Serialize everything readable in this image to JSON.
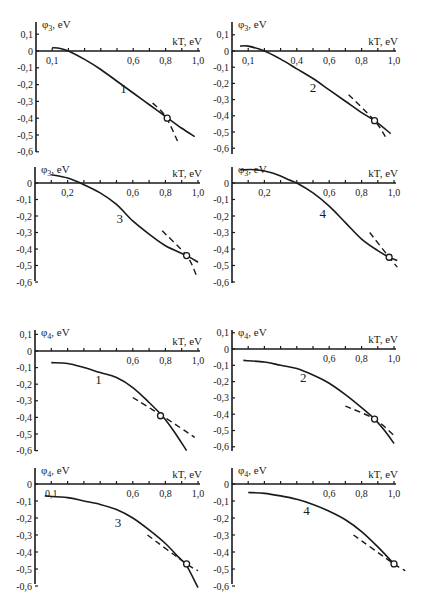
{
  "figure": {
    "groups": [
      {
        "name": "phi3",
        "ylabel_main": "φ",
        "ylabel_sub": "3",
        "ylabel_unit": ", eV"
      },
      {
        "name": "phi4",
        "ylabel_main": "φ",
        "ylabel_sub": "4",
        "ylabel_unit": ", eV"
      }
    ],
    "xlabel": "kT, eV"
  },
  "chart_data": [
    {
      "type": "line",
      "id": "phi3-1",
      "curve_label": "1",
      "ylabel": "φ3, eV",
      "xlabel": "kT, eV",
      "xlim": [
        0,
        1.0
      ],
      "ylim": [
        -0.6,
        0.1
      ],
      "x_tick_labels": [
        "0,1",
        "0,6",
        "0,8",
        "1,0"
      ],
      "x_tick_values": [
        0.1,
        0.6,
        0.8,
        1.0
      ],
      "y_tick_labels": [
        "0,1",
        "0",
        "-0,1",
        "-0,2",
        "-0,3",
        "-0,4",
        "-0,5",
        "-0,6"
      ],
      "y_tick_values": [
        0.1,
        0,
        -0.1,
        -0.2,
        -0.3,
        -0.4,
        -0.5,
        -0.6
      ],
      "label_pos": [
        0.52,
        -0.25
      ],
      "series": [
        {
          "name": "solid",
          "style": "solid",
          "x": [
            0.1,
            0.15,
            0.2,
            0.3,
            0.4,
            0.5,
            0.6,
            0.7,
            0.8,
            0.9,
            0.98
          ],
          "y": [
            0.02,
            0.015,
            0.0,
            -0.05,
            -0.11,
            -0.18,
            -0.25,
            -0.32,
            -0.39,
            -0.46,
            -0.51
          ]
        },
        {
          "name": "dashed",
          "style": "dashed",
          "x": [
            0.72,
            0.8,
            0.88
          ],
          "y": [
            -0.31,
            -0.39,
            -0.55
          ]
        }
      ],
      "marker": {
        "x": 0.81,
        "y": -0.4
      }
    },
    {
      "type": "line",
      "id": "phi3-2",
      "curve_label": "2",
      "ylabel": "φ3, eV",
      "xlabel": "kT, eV",
      "xlim": [
        0,
        1.0
      ],
      "ylim": [
        -0.6,
        0.1
      ],
      "x_tick_labels": [
        "0,1",
        "0,4",
        "0,6",
        "0,8",
        "1,0"
      ],
      "x_tick_values": [
        0.1,
        0.4,
        0.6,
        0.8,
        1.0
      ],
      "y_tick_labels": [
        "0,1",
        "0",
        "-0,1",
        "-0,2",
        "-0,3",
        "-0,4",
        "-0,5",
        "-0,6"
      ],
      "y_tick_values": [
        0.1,
        0,
        -0.1,
        -0.2,
        -0.3,
        -0.4,
        -0.5,
        -0.6
      ],
      "label_pos": [
        0.48,
        -0.25
      ],
      "series": [
        {
          "name": "solid",
          "style": "solid",
          "x": [
            0.05,
            0.1,
            0.2,
            0.3,
            0.4,
            0.5,
            0.6,
            0.7,
            0.8,
            0.88,
            0.98
          ],
          "y": [
            0.03,
            0.03,
            0.0,
            -0.05,
            -0.11,
            -0.17,
            -0.24,
            -0.31,
            -0.38,
            -0.43,
            -0.51
          ]
        },
        {
          "name": "dashed",
          "style": "dashed",
          "x": [
            0.72,
            0.88,
            0.96
          ],
          "y": [
            -0.27,
            -0.43,
            -0.55
          ]
        }
      ],
      "marker": {
        "x": 0.88,
        "y": -0.43
      }
    },
    {
      "type": "line",
      "id": "phi3-3",
      "curve_label": "3",
      "ylabel": "φ3, eV",
      "xlabel": "kT, eV",
      "xlim": [
        0,
        1.0
      ],
      "ylim": [
        -0.6,
        0.05
      ],
      "x_tick_labels": [
        "0,2",
        "0,6",
        "0,8",
        "1,0"
      ],
      "x_tick_values": [
        0.2,
        0.6,
        0.8,
        1.0
      ],
      "y_tick_labels": [
        "0",
        "-0,1",
        "-0,2",
        "-0,3",
        "-0,4",
        "-0,5",
        "-0,6"
      ],
      "y_tick_values": [
        0,
        -0.1,
        -0.2,
        -0.3,
        -0.4,
        -0.5,
        -0.6
      ],
      "label_pos": [
        0.5,
        -0.24
      ],
      "series": [
        {
          "name": "solid",
          "style": "solid",
          "x": [
            0.1,
            0.2,
            0.3,
            0.4,
            0.5,
            0.6,
            0.7,
            0.8,
            0.93,
            1.0
          ],
          "y": [
            0.05,
            0.03,
            -0.01,
            -0.06,
            -0.13,
            -0.23,
            -0.31,
            -0.38,
            -0.44,
            -0.48
          ]
        },
        {
          "name": "dashed",
          "style": "dashed",
          "x": [
            0.78,
            0.93,
            0.99
          ],
          "y": [
            -0.29,
            -0.44,
            -0.56
          ]
        }
      ],
      "marker": {
        "x": 0.93,
        "y": -0.44
      }
    },
    {
      "type": "line",
      "id": "phi3-4",
      "curve_label": "4",
      "ylabel": "φ3, eV",
      "xlabel": "kT, eV",
      "xlim": [
        0,
        1.0
      ],
      "ylim": [
        -0.6,
        0.1
      ],
      "x_tick_labels": [
        "0,2",
        "0,6",
        "0,8",
        "1,0"
      ],
      "x_tick_values": [
        0.2,
        0.6,
        0.8,
        1.0
      ],
      "y_tick_labels": [
        "0",
        "-0,1",
        "-0,2",
        "-0,3",
        "-0,4",
        "-0,5",
        "-0,6"
      ],
      "y_tick_values": [
        0,
        -0.1,
        -0.2,
        -0.3,
        -0.4,
        -0.5,
        -0.6
      ],
      "label_pos": [
        0.54,
        -0.21
      ],
      "series": [
        {
          "name": "solid",
          "style": "solid",
          "x": [
            0.05,
            0.15,
            0.25,
            0.35,
            0.4,
            0.5,
            0.6,
            0.7,
            0.8,
            0.9,
            0.97,
            1.02
          ],
          "y": [
            0.08,
            0.08,
            0.06,
            0.02,
            0.0,
            -0.06,
            -0.14,
            -0.24,
            -0.34,
            -0.41,
            -0.45,
            -0.47
          ]
        },
        {
          "name": "dashed",
          "style": "dashed",
          "x": [
            0.85,
            0.97,
            1.02
          ],
          "y": [
            -0.3,
            -0.45,
            -0.51
          ]
        }
      ],
      "marker": {
        "x": 0.97,
        "y": -0.45
      }
    },
    {
      "type": "line",
      "id": "phi4-1",
      "curve_label": "1",
      "ylabel": "φ4, eV",
      "xlabel": "kT, eV",
      "xlim": [
        0,
        1.0
      ],
      "ylim": [
        -0.6,
        0.1
      ],
      "x_tick_labels": [
        "0,6",
        "0,8",
        "1,0"
      ],
      "x_tick_values": [
        0.6,
        0.8,
        1.0
      ],
      "y_tick_labels": [
        "0,1",
        "0",
        "-0,1",
        "-0,2",
        "-0,3",
        "-0,4",
        "-0,5",
        "-0,6"
      ],
      "y_tick_values": [
        0.1,
        0,
        -0.1,
        -0.2,
        -0.3,
        -0.4,
        -0.5,
        -0.6
      ],
      "label_pos": [
        0.37,
        -0.2
      ],
      "series": [
        {
          "name": "solid",
          "style": "solid",
          "x": [
            0.1,
            0.2,
            0.3,
            0.4,
            0.5,
            0.6,
            0.7,
            0.78,
            0.85,
            0.93
          ],
          "y": [
            -0.07,
            -0.075,
            -0.1,
            -0.13,
            -0.16,
            -0.22,
            -0.31,
            -0.39,
            -0.48,
            -0.6
          ]
        },
        {
          "name": "dashed",
          "style": "dashed",
          "x": [
            0.6,
            0.78,
            0.98
          ],
          "y": [
            -0.28,
            -0.39,
            -0.52
          ]
        }
      ],
      "marker": {
        "x": 0.77,
        "y": -0.39
      }
    },
    {
      "type": "line",
      "id": "phi4-2",
      "curve_label": "2",
      "ylabel": "φ4, eV",
      "xlabel": "kT, eV",
      "xlim": [
        0,
        1.0
      ],
      "ylim": [
        -0.6,
        0.1
      ],
      "x_tick_labels": [
        "0,6",
        "0,8",
        "1,0"
      ],
      "x_tick_values": [
        0.6,
        0.8,
        1.0
      ],
      "y_tick_labels": [
        "0,1",
        "0",
        "-0,1",
        "-0,2",
        "-0,3",
        "-0,4",
        "-0,5",
        "-0,6"
      ],
      "y_tick_values": [
        0.1,
        0,
        -0.1,
        -0.2,
        -0.3,
        -0.4,
        -0.5,
        -0.6
      ],
      "label_pos": [
        0.42,
        -0.2
      ],
      "series": [
        {
          "name": "solid",
          "style": "solid",
          "x": [
            0.07,
            0.2,
            0.3,
            0.4,
            0.5,
            0.6,
            0.7,
            0.8,
            0.88,
            0.95,
            1.0
          ],
          "y": [
            -0.07,
            -0.08,
            -0.1,
            -0.12,
            -0.16,
            -0.21,
            -0.28,
            -0.36,
            -0.43,
            -0.51,
            -0.58
          ]
        },
        {
          "name": "dashed",
          "style": "dashed",
          "x": [
            0.7,
            0.88,
            1.0
          ],
          "y": [
            -0.35,
            -0.43,
            -0.53
          ]
        }
      ],
      "marker": {
        "x": 0.88,
        "y": -0.43
      }
    },
    {
      "type": "line",
      "id": "phi4-3",
      "curve_label": "3",
      "ylabel": "φ4, eV",
      "xlabel": "kT, eV",
      "xlim": [
        0,
        1.0
      ],
      "ylim": [
        -0.6,
        0.05
      ],
      "x_tick_labels": [
        "0,1",
        "0,6",
        "0,8",
        "1,0"
      ],
      "x_tick_values": [
        0.1,
        0.6,
        0.8,
        1.0
      ],
      "y_tick_labels": [
        "0",
        "-0,1",
        "-0,2",
        "-0,3",
        "-0,4",
        "-0,5",
        "-0,6"
      ],
      "y_tick_values": [
        0,
        -0.1,
        -0.2,
        -0.3,
        -0.4,
        -0.5,
        -0.6
      ],
      "label_pos": [
        0.49,
        -0.25
      ],
      "series": [
        {
          "name": "solid",
          "style": "solid",
          "x": [
            0.06,
            0.2,
            0.3,
            0.4,
            0.5,
            0.6,
            0.7,
            0.8,
            0.88,
            0.93,
            1.0
          ],
          "y": [
            -0.07,
            -0.08,
            -0.1,
            -0.12,
            -0.15,
            -0.2,
            -0.27,
            -0.35,
            -0.43,
            -0.48,
            -0.61
          ]
        },
        {
          "name": "dashed",
          "style": "dashed",
          "x": [
            0.69,
            0.93,
            1.0
          ],
          "y": [
            -0.3,
            -0.47,
            -0.51
          ]
        }
      ],
      "marker": {
        "x": 0.93,
        "y": -0.47
      }
    },
    {
      "type": "line",
      "id": "phi4-4",
      "curve_label": "4",
      "ylabel": "φ4, eV",
      "xlabel": "kT, eV",
      "xlim": [
        0,
        1.0
      ],
      "ylim": [
        -0.6,
        0.05
      ],
      "x_tick_labels": [
        "0,6",
        "0,8",
        "1,0"
      ],
      "x_tick_values": [
        0.6,
        0.8,
        1.0
      ],
      "y_tick_labels": [
        "0",
        "-0,1",
        "-0,2",
        "-0,3",
        "-0,4",
        "-0,5",
        "-0,6"
      ],
      "y_tick_values": [
        0,
        -0.1,
        -0.2,
        -0.3,
        -0.4,
        -0.5,
        -0.6
      ],
      "label_pos": [
        0.44,
        -0.18
      ],
      "series": [
        {
          "name": "solid",
          "style": "solid",
          "x": [
            0.1,
            0.2,
            0.3,
            0.4,
            0.5,
            0.6,
            0.7,
            0.8,
            0.9,
            1.0
          ],
          "y": [
            -0.05,
            -0.055,
            -0.07,
            -0.09,
            -0.12,
            -0.16,
            -0.21,
            -0.28,
            -0.37,
            -0.47
          ]
        },
        {
          "name": "dashed",
          "style": "dashed",
          "x": [
            0.75,
            1.0,
            1.07
          ],
          "y": [
            -0.3,
            -0.47,
            -0.51
          ]
        }
      ],
      "marker": {
        "x": 1.0,
        "y": -0.47
      }
    }
  ],
  "layout": {
    "panels": [
      {
        "id": "phi3-1",
        "x0": 36,
        "x1": 198,
        "y0": 51,
        "px_per_01_y": 16.8,
        "axis_top": 22,
        "axis_bottom": 152,
        "group": 0
      },
      {
        "id": "phi3-2",
        "x0": 232,
        "x1": 394,
        "y0": 51,
        "px_per_01_y": 16.2,
        "axis_top": 22,
        "axis_bottom": 154,
        "group": 0
      },
      {
        "id": "phi3-3",
        "x0": 35,
        "x1": 198,
        "y0": 183,
        "px_per_01_y": 16.5,
        "axis_top": 167,
        "axis_bottom": 281,
        "group": 0
      },
      {
        "id": "phi3-4",
        "x0": 232,
        "x1": 394,
        "y0": 183,
        "px_per_01_y": 16.5,
        "axis_top": 167,
        "axis_bottom": 283,
        "group": 0
      },
      {
        "id": "phi4-1",
        "x0": 35,
        "x1": 198,
        "y0": 351,
        "px_per_01_y": 16.6,
        "axis_top": 330,
        "axis_bottom": 451,
        "group": 1
      },
      {
        "id": "phi4-2",
        "x0": 232,
        "x1": 394,
        "y0": 349,
        "px_per_01_y": 16.3,
        "axis_top": 330,
        "axis_bottom": 451,
        "group": 1
      },
      {
        "id": "phi4-3",
        "x0": 35,
        "x1": 198,
        "y0": 484,
        "px_per_01_y": 17.0,
        "axis_top": 468,
        "axis_bottom": 584,
        "group": 1
      },
      {
        "id": "phi4-4",
        "x0": 232,
        "x1": 394,
        "y0": 484,
        "px_per_01_y": 17.0,
        "axis_top": 468,
        "axis_bottom": 584,
        "group": 1
      }
    ]
  }
}
